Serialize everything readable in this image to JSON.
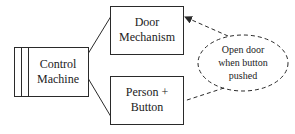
{
  "diagram": {
    "type": "context-diagram",
    "colors": {
      "stroke": "#2a2a2a",
      "text": "#222222",
      "background": "#ffffff"
    },
    "nodes": {
      "machine": {
        "lines": [
          "Control",
          "Machine"
        ]
      },
      "door": {
        "lines": [
          "Door",
          "Mechanism"
        ]
      },
      "person": {
        "lines": [
          "Person +",
          "Button"
        ]
      },
      "requirement": {
        "lines": [
          "Open door",
          "when button",
          "pushed"
        ]
      }
    },
    "edges": [
      {
        "from": "Control Machine",
        "to": "Door Mechanism",
        "style": "solid"
      },
      {
        "from": "Control Machine",
        "to": "Person + Button",
        "style": "solid"
      },
      {
        "from": "Open door when button pushed",
        "to": "Door Mechanism",
        "style": "dashed-arrow"
      },
      {
        "from": "Open door when button pushed",
        "to": "Person + Button",
        "style": "dashed"
      }
    ]
  }
}
